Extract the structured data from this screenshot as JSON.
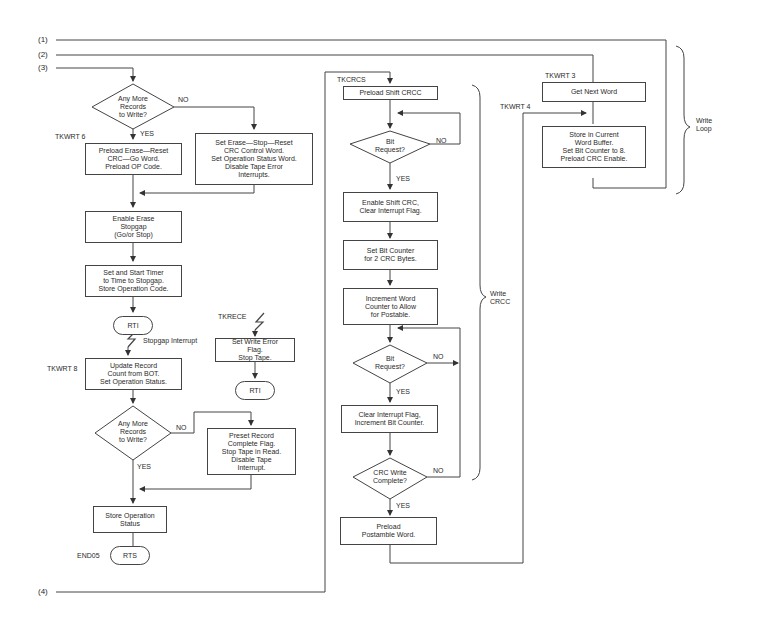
{
  "connectors": {
    "c1": "(1)",
    "c2": "(2)",
    "c3": "(3)",
    "c4": "(4)"
  },
  "left_column": {
    "decision1": {
      "text": "Any More\nRecords\nto Write?",
      "no": "NO",
      "yes": "YES"
    },
    "label_tkwrt6": "TKWRT 6",
    "preload_erase": "Preload Erase—Reset\nCRC—Go Word.\nPreload OP Code.",
    "set_erase_stop": "Set Erase—Stop—Reset\nCRC  Control Word.\nSet Operation Status Word.\nDisable Tape Error\nInterrupts.",
    "enable_erase": "Enable Erase\nStopgap\n(Go/or Stop)",
    "set_timer": "Set and Start Timer\nto Time to Stopgap.\nStore Operation Code.",
    "rti1": "RTI",
    "stopgap_interrupt": "Stopgap Interrupt",
    "label_tkwrt8": "TKWRT 8",
    "update_record": "Update Record\nCount from BOT.\nSet Operation Status.",
    "decision2": {
      "text": "Any More\nRecords\nto Write?",
      "no": "NO",
      "yes": "YES"
    },
    "preset_record": "Preset Record\nComplete Flag.\nStop Tape in Read.\nDisable Tape\nInterrupt.",
    "store_status": "Store Operation\nStatus",
    "label_end05": "END05",
    "rts": "RTS"
  },
  "error_branch": {
    "label_tkrece": "TKRECE",
    "set_write_error": "Set Write Error\nFlag.\nStop Tape.",
    "rti2": "RTI"
  },
  "crc_column": {
    "label_tkcrcs": "TKCRCS",
    "preload_shift": "Preload Shift CRCC",
    "decision_bit1": {
      "text": "Bit\nRequest?",
      "no": "NO",
      "yes": "YES"
    },
    "enable_shift": "Enable Shift CRC,\nClear Interrupt Flag.",
    "set_bit_counter": "Set Bit Counter\nfor 2 CRC Bytes.",
    "increment_word": "Increment Word\nCounter to Allow\nfor Postable.",
    "decision_bit2": {
      "text": "Bit\nRequest?",
      "no": "NO",
      "yes": "YES"
    },
    "clear_interrupt": "Clear Interrupt Flag,\nIncrement Bit Counter.",
    "decision_crc": {
      "text": "CRC Write\nComplete?",
      "no": "NO",
      "yes": "YES"
    },
    "preload_postamble": "Preload\nPostamble Word.",
    "brace_label": "Write\nCRCC"
  },
  "write_loop": {
    "label_tkwrt3": "TKWRT 3",
    "get_next_word": "Get Next Word",
    "label_tkwrt4": "TKWRT 4",
    "store_current": "Store in Current\nWord Buffer.\nSet Bit Counter to 8.\nPreload CRC Enable.",
    "brace_label": "Write\nLoop"
  },
  "colors": {
    "line": "#444444",
    "text": "#2a2a2a"
  }
}
